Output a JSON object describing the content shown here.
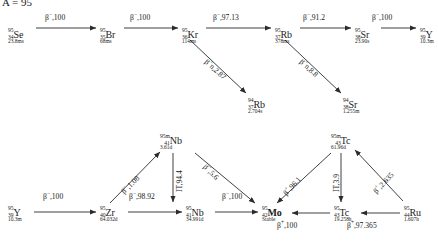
{
  "diagram": {
    "title": "A = 95",
    "type": "isobaric-decay-chain",
    "background": "#ffffff",
    "line_color": "#2b2b2b"
  },
  "nuclides": [
    {
      "id": "se95",
      "symbol": "Se",
      "mass": "95",
      "z": "34",
      "half_life": "23.8ms",
      "x": 8,
      "y": 26,
      "bold": false
    },
    {
      "id": "br95",
      "symbol": "Br",
      "mass": "95",
      "z": "35",
      "half_life": "68ms",
      "x": 100,
      "y": 26,
      "bold": false
    },
    {
      "id": "kr95",
      "symbol": "Kr",
      "mass": "95",
      "z": "36",
      "half_life": "114ms",
      "x": 182,
      "y": 26,
      "bold": false
    },
    {
      "id": "rb95",
      "symbol": "Rb",
      "mass": "95",
      "z": "37",
      "half_life": "378ms",
      "x": 275,
      "y": 26,
      "bold": false
    },
    {
      "id": "sr95",
      "symbol": "Sr",
      "mass": "95",
      "z": "38",
      "half_life": "23.90s",
      "x": 355,
      "y": 26,
      "bold": false
    },
    {
      "id": "y95t",
      "symbol": "Y",
      "mass": "95",
      "z": "39",
      "half_life": "10.3m",
      "x": 420,
      "y": 26,
      "bold": false
    },
    {
      "id": "rb94",
      "symbol": "Rb",
      "mass": "94",
      "z": "37",
      "half_life": "2.704s",
      "x": 248,
      "y": 96,
      "bold": false
    },
    {
      "id": "sr94",
      "symbol": "Sr",
      "mass": "94",
      "z": "38",
      "half_life": "1.255m",
      "x": 343,
      "y": 96,
      "bold": false
    },
    {
      "id": "nb95m",
      "symbol": "Nb",
      "mass": "95m",
      "z": "41",
      "half_life": "3.61d",
      "x": 160,
      "y": 132,
      "bold": false
    },
    {
      "id": "tc95m",
      "symbol": "Tc",
      "mass": "95m",
      "z": "43",
      "half_life": "61.96d",
      "x": 331,
      "y": 132,
      "bold": false
    },
    {
      "id": "y95b",
      "symbol": "Y",
      "mass": "95",
      "z": "39",
      "half_life": "10.3m",
      "x": 8,
      "y": 204,
      "bold": false
    },
    {
      "id": "zr95",
      "symbol": "Zr",
      "mass": "95",
      "z": "40",
      "half_life": "64.032d",
      "x": 100,
      "y": 204,
      "bold": false
    },
    {
      "id": "nb95",
      "symbol": "Nb",
      "mass": "95",
      "z": "41",
      "half_life": "34.991d",
      "x": 186,
      "y": 204,
      "bold": false
    },
    {
      "id": "mo95",
      "symbol": "Mo",
      "mass": "95",
      "z": "42",
      "half_life": "Stable",
      "x": 262,
      "y": 204,
      "bold": true
    },
    {
      "id": "tc95",
      "symbol": "Tc",
      "mass": "95",
      "z": "43",
      "half_life": "19.258h",
      "x": 334,
      "y": 204,
      "bold": false
    },
    {
      "id": "ru95",
      "symbol": "Ru",
      "mass": "95",
      "z": "44",
      "half_life": "1.607h",
      "x": 404,
      "y": 204,
      "bold": false
    }
  ],
  "transitions": [
    {
      "id": "t1",
      "from": "se95",
      "to": "br95",
      "mode": "β−",
      "branch": "100",
      "label": "β−,100",
      "x": 45,
      "y": 14,
      "rot": 0
    },
    {
      "id": "t2",
      "from": "br95",
      "to": "kr95",
      "mode": "β−",
      "branch": "100",
      "label": "β−,100",
      "x": 130,
      "y": 14,
      "rot": 0
    },
    {
      "id": "t3",
      "from": "kr95",
      "to": "rb95",
      "mode": "β−",
      "branch": "97.13",
      "label": "β−,97.13",
      "x": 213,
      "y": 14,
      "rot": 0
    },
    {
      "id": "t4",
      "from": "rb95",
      "to": "sr95",
      "mode": "β−",
      "branch": "91.2",
      "label": "β−,91.2",
      "x": 303,
      "y": 14,
      "rot": 0
    },
    {
      "id": "t5",
      "from": "sr95",
      "to": "y95t",
      "mode": "β−",
      "branch": "100",
      "label": "β−,100",
      "x": 372,
      "y": 14,
      "rot": 0
    },
    {
      "id": "t6",
      "from": "kr95",
      "to": "rb94",
      "mode": "β−n",
      "branch": "2.87",
      "label": "β−n,2.87",
      "x": 208,
      "y": 58,
      "rot": 42
    },
    {
      "id": "t7",
      "from": "rb95",
      "to": "sr94",
      "mode": "β−n",
      "branch": "8.8",
      "label": "β−n,8.8",
      "x": 303,
      "y": 58,
      "rot": 42
    },
    {
      "id": "t8",
      "from": "y95b",
      "to": "zr95",
      "mode": "β−",
      "branch": "100",
      "label": "β−,100",
      "x": 43,
      "y": 193,
      "rot": 0
    },
    {
      "id": "t9",
      "from": "zr95",
      "to": "nb95",
      "mode": "β−",
      "branch": "98.92",
      "label": "β−,98.92",
      "x": 129,
      "y": 193,
      "rot": 0
    },
    {
      "id": "t10",
      "from": "zr95",
      "to": "nb95m",
      "mode": "β−",
      "branch": "1.08",
      "label": "β−,1.08",
      "x": 120,
      "y": 190,
      "rot": -45
    },
    {
      "id": "t11",
      "from": "nb95m",
      "to": "nb95",
      "mode": "IT",
      "branch": "94.4",
      "label": "IT,94.4",
      "x": 176,
      "y": 192,
      "rot": -90
    },
    {
      "id": "t12",
      "from": "nb95",
      "to": "mo95",
      "mode": "β−",
      "branch": "100",
      "label": "β−,100",
      "x": 222,
      "y": 193,
      "rot": 0
    },
    {
      "id": "t13",
      "from": "nb95m",
      "to": "mo95",
      "mode": "β−",
      "branch": "5.6",
      "label": "β−,5.6",
      "x": 207,
      "y": 163,
      "rot": 45
    },
    {
      "id": "t14",
      "from": "tc95m",
      "to": "mo95",
      "mode": "β+",
      "branch": "96.1",
      "label": "β+,96.1",
      "x": 282,
      "y": 192,
      "rot": -48
    },
    {
      "id": "t15",
      "from": "tc95m",
      "to": "tc95",
      "mode": "IT",
      "branch": "3.9",
      "label": "IT,3.9",
      "x": 333,
      "y": 192,
      "rot": -90
    },
    {
      "id": "t16",
      "from": "tc95",
      "to": "mo95",
      "mode": "β+",
      "branch": "100",
      "label": "β+,100",
      "x": 277,
      "y": 222,
      "rot": 0
    },
    {
      "id": "t17",
      "from": "ru95",
      "to": "tc95",
      "mode": "β+",
      "branch": "97.365",
      "label": "β+,97.365",
      "x": 347,
      "y": 222,
      "rot": 0
    },
    {
      "id": "t18",
      "from": "ru95",
      "to": "tc95m",
      "mode": "β+",
      "branch": "2.635",
      "label": "β+,2.635",
      "x": 372,
      "y": 190,
      "rot": -47
    }
  ]
}
